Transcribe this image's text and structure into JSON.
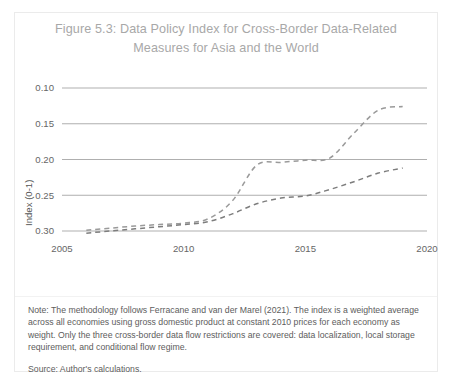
{
  "figure": {
    "title": "Figure 5.3: Data Policy Index for Cross-Border Data-Related Measures for Asia and the World",
    "note": "Note: The methodology follows Ferracane and van der Marel (2021). The index is a weighted average across all economies using gross domestic product at constant 2010 prices for each economy as weight. Only the three cross-border data flow restrictions are covered: data localization, local storage requirement, and conditional flow regime.",
    "source": "Source: Author's calculations."
  },
  "chart_data": {
    "type": "line",
    "title": "Figure 5.3: Data Policy Index for Cross-Border Data-Related Measures for Asia and the World",
    "xlabel": "",
    "ylabel": "Index (0-1)",
    "xlim": [
      2005,
      2020
    ],
    "ylim": [
      0.1,
      0.3
    ],
    "y_axis_inverted": true,
    "grid": true,
    "legend_position": "bottom",
    "xticks": [
      "2005",
      "2010",
      "2015",
      "2020"
    ],
    "xtick_values": [
      2005,
      2010,
      2015,
      2020
    ],
    "yticks": [
      "0.10",
      "0.15",
      "0.20",
      "0.25",
      "0.30"
    ],
    "ytick_values": [
      0.1,
      0.15,
      0.2,
      0.25,
      0.3
    ],
    "x": [
      2006,
      2007,
      2008,
      2009,
      2010,
      2011,
      2012,
      2013,
      2014,
      2015,
      2016,
      2017,
      2018,
      2019
    ],
    "series": [
      {
        "name": "Asia",
        "color": "#9a9a9a",
        "style": "dashed",
        "values": [
          0.299,
          0.296,
          0.293,
          0.291,
          0.289,
          0.283,
          0.258,
          0.208,
          0.204,
          0.201,
          0.198,
          0.163,
          0.131,
          0.126
        ]
      },
      {
        "name": "World",
        "color": "#7d7d7d",
        "style": "dashed",
        "values": [
          0.303,
          0.3,
          0.297,
          0.294,
          0.291,
          0.287,
          0.276,
          0.262,
          0.254,
          0.251,
          0.242,
          0.231,
          0.219,
          0.212
        ]
      }
    ]
  },
  "legend": {
    "items": [
      {
        "label": "Asia"
      },
      {
        "label": "World"
      }
    ]
  }
}
